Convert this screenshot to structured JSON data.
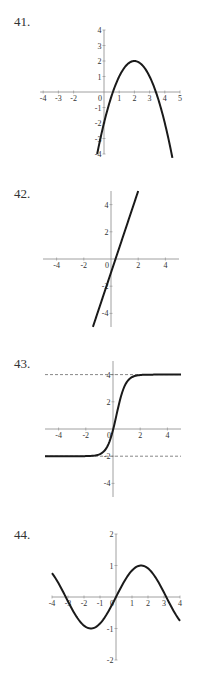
{
  "problems": [
    {
      "number": "41.",
      "label_y": 14
    },
    {
      "number": "42.",
      "label_y": 188
    },
    {
      "number": "43.",
      "label_y": 356
    },
    {
      "number": "44.",
      "label_y": 528
    }
  ],
  "chart_data": [
    {
      "type": "line",
      "title": "41.",
      "function": "y = 2 - (x - 2)^2",
      "x_range_plotted": [
        -0.45,
        4.45
      ],
      "xlim": [
        -4.5,
        5
      ],
      "ylim": [
        -4,
        4
      ],
      "xticks": [
        "-4",
        "-3",
        "-2",
        "0",
        "1",
        "2",
        "3",
        "4",
        "5"
      ],
      "yticks": [
        "4",
        "3",
        "2",
        "1",
        "-1",
        "-2",
        "-3",
        "-4"
      ],
      "key_points": {
        "vertex": [
          2,
          2
        ],
        "roots": [
          0.59,
          3.41
        ]
      },
      "grid": false
    },
    {
      "type": "line",
      "title": "42.",
      "function": "y = 3x - 1",
      "x_range_plotted": [
        -1.33,
        2
      ],
      "xlim": [
        -5,
        5
      ],
      "ylim": [
        -5,
        5
      ],
      "xticks": [
        "-4",
        "-2",
        "0",
        "2",
        "4"
      ],
      "yticks": [
        "4",
        "2",
        "-2",
        "-4"
      ],
      "key_points": {
        "x_intercept": 0.33,
        "y_intercept": -1
      },
      "grid": false
    },
    {
      "type": "line",
      "title": "43.",
      "function": "sigmoid from y=-2 to y=4, center x≈0.25",
      "x_range_plotted": [
        -5,
        5
      ],
      "xlim": [
        -5,
        5
      ],
      "ylim": [
        -5,
        5
      ],
      "xticks": [
        "-4",
        "-2",
        "0",
        "2",
        "4"
      ],
      "yticks": [
        "4",
        "2",
        "-2",
        "-4"
      ],
      "asymptotes": [
        4,
        -2
      ],
      "asymptote_style": "dashed",
      "grid": false
    },
    {
      "type": "line",
      "title": "44.",
      "function": "y = sin(x)",
      "x_range_plotted": [
        -4,
        4
      ],
      "xlim": [
        -4,
        4
      ],
      "ylim": [
        -2,
        2
      ],
      "xticks": [
        "-4",
        "-3",
        "-2",
        "-1",
        "0",
        "1",
        "2",
        "3",
        "4"
      ],
      "yticks": [
        "2",
        "1",
        "-1",
        "-2"
      ],
      "grid": false
    }
  ]
}
